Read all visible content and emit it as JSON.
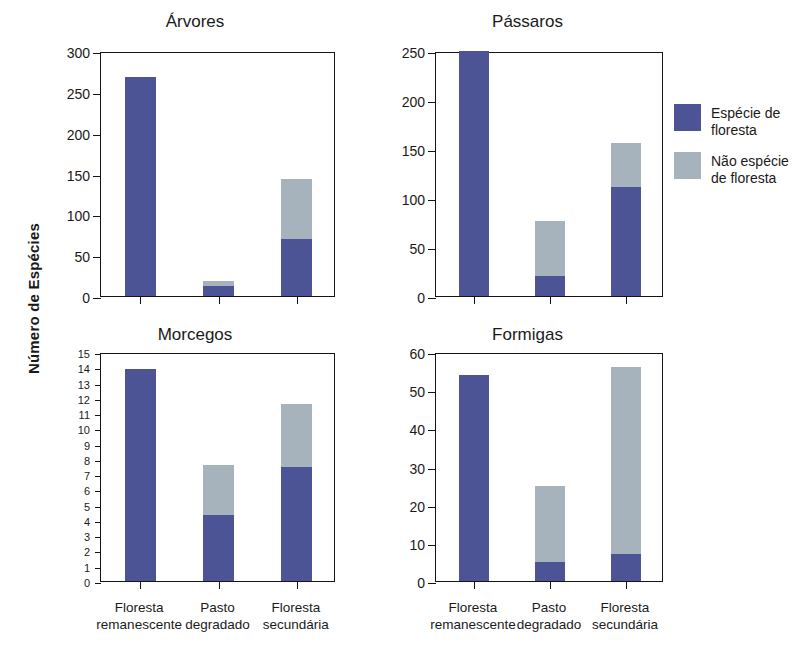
{
  "figure": {
    "ylabel": "Número de Espécies",
    "categories": [
      "Floresta\nremanescente",
      "Pasto\ndegradado",
      "Floresta\nsecundária"
    ]
  },
  "legend": {
    "entries": [
      {
        "label": "Espécie de\nfloresta",
        "color": "#4c5496",
        "key": "forest"
      },
      {
        "label": "Não espécie\nde floresta",
        "color": "#a6b2bc",
        "key": "nonforest"
      }
    ]
  },
  "chart_data": [
    {
      "type": "bar",
      "title": "Árvores",
      "xlabel": "",
      "ylabel": "Número de Espécies",
      "ylim": [
        0,
        300
      ],
      "yticks": [
        0,
        50,
        100,
        150,
        200,
        250,
        300
      ],
      "ytick_labels": [
        "0",
        "50",
        "100",
        "150",
        "200",
        "250",
        "300"
      ],
      "grid": false,
      "stacked": true,
      "categories": [
        "Floresta remanescente",
        "Pasto degradado",
        "Floresta secundária"
      ],
      "series": [
        {
          "name": "Espécie de floresta",
          "color": "#4c5496",
          "values": [
            268,
            12,
            70
          ]
        },
        {
          "name": "Não espécie de floresta",
          "color": "#a6b2bc",
          "values": [
            0,
            6,
            73
          ]
        }
      ],
      "totals": [
        268,
        18,
        143
      ]
    },
    {
      "type": "bar",
      "title": "Pássaros",
      "xlabel": "",
      "ylabel": "Número de Espécies",
      "ylim": [
        0,
        250
      ],
      "yticks": [
        0,
        50,
        100,
        150,
        200,
        250
      ],
      "ytick_labels": [
        "0",
        "50",
        "100",
        "150",
        "200",
        "250"
      ],
      "grid": false,
      "stacked": true,
      "categories": [
        "Floresta remanescente",
        "Pasto degradado",
        "Floresta secundária"
      ],
      "series": [
        {
          "name": "Espécie de floresta",
          "color": "#4c5496",
          "values": [
            250,
            20,
            111
          ]
        },
        {
          "name": "Não espécie de floresta",
          "color": "#a6b2bc",
          "values": [
            0,
            57,
            45
          ]
        }
      ],
      "totals": [
        250,
        77,
        156
      ]
    },
    {
      "type": "bar",
      "title": "Morcegos",
      "xlabel": "",
      "ylabel": "Número de Espécies",
      "ylim": [
        0,
        15
      ],
      "yticks": [
        0,
        1,
        2,
        3,
        4,
        5,
        6,
        7,
        8,
        9,
        10,
        11,
        12,
        13,
        14,
        15
      ],
      "ytick_labels": [
        "0",
        "1",
        "2",
        "3",
        "4",
        "5",
        "6",
        "7",
        "8",
        "9",
        "10",
        "11",
        "12",
        "13",
        "14",
        "15"
      ],
      "grid": false,
      "stacked": true,
      "categories": [
        "Floresta remanescente",
        "Pasto degradado",
        "Floresta secundária"
      ],
      "series": [
        {
          "name": "Espécie de floresta",
          "color": "#4c5496",
          "values": [
            13.9,
            4.3,
            7.5
          ]
        },
        {
          "name": "Não espécie de floresta",
          "color": "#a6b2bc",
          "values": [
            0,
            3.3,
            4.1
          ]
        }
      ],
      "totals": [
        13.9,
        7.6,
        11.6
      ]
    },
    {
      "type": "bar",
      "title": "Formigas",
      "xlabel": "",
      "ylabel": "Número de Espécies",
      "ylim": [
        0,
        60
      ],
      "yticks": [
        0,
        10,
        20,
        30,
        40,
        50,
        60
      ],
      "ytick_labels": [
        "0",
        "10",
        "20",
        "30",
        "40",
        "50",
        "60"
      ],
      "grid": false,
      "stacked": true,
      "categories": [
        "Floresta remanescente",
        "Pasto degradado",
        "Floresta secundária"
      ],
      "series": [
        {
          "name": "Espécie de floresta",
          "color": "#4c5496",
          "values": [
            54,
            5,
            7
          ]
        },
        {
          "name": "Não espécie de floresta",
          "color": "#a6b2bc",
          "values": [
            0,
            20,
            49
          ]
        }
      ],
      "totals": [
        54,
        25,
        56
      ]
    }
  ]
}
